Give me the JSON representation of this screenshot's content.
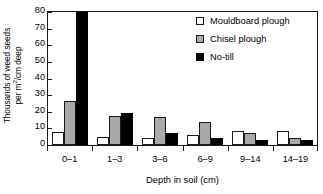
{
  "chart_data": {
    "type": "bar",
    "title": "",
    "categories": [
      "0–1",
      "1–3",
      "3–6",
      "6–9",
      "9–14",
      "14–19"
    ],
    "series": [
      {
        "name": "Mouldboard plough",
        "color": "#ffffff",
        "values": [
          8,
          5,
          4.5,
          5.8,
          8.5,
          8.5
        ]
      },
      {
        "name": "Chisel plough",
        "color": "#a9a9a9",
        "values": [
          26.5,
          17.5,
          16.8,
          14,
          7.5,
          4.2
        ]
      },
      {
        "name": "No-till",
        "color": "#000000",
        "values": [
          80,
          19.5,
          7.5,
          4.2,
          3.2,
          3
        ]
      }
    ],
    "xlabel": "Depth in soil (cm)",
    "ylabel_line1": "Thousands of weed seeds",
    "ylabel_line2_pre": "per m",
    "ylabel_line2_sup": "2",
    "ylabel_line2_post": "/cm deep",
    "ylim": [
      0,
      80
    ],
    "yticks": [
      0,
      10,
      20,
      30,
      40,
      50,
      60,
      70,
      80
    ],
    "ytick_labels": [
      "0",
      "10",
      "20",
      "30",
      "40",
      "50",
      "60",
      "70",
      "80"
    ],
    "grid": false,
    "legend_position": "top-right",
    "frame": true
  },
  "legend": {
    "items": [
      {
        "label": "Mouldboard plough",
        "swatch": "white-square-swatch"
      },
      {
        "label": "Chisel plough",
        "swatch": "gray-square-swatch"
      },
      {
        "label": "No-till",
        "swatch": "black-square-swatch"
      }
    ]
  }
}
